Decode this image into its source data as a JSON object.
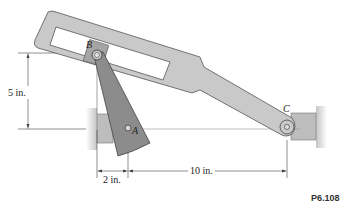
{
  "figure": {
    "id_label": "P6.108",
    "points": {
      "A": "A",
      "B": "B",
      "C": "C"
    },
    "dimensions": {
      "vertical": "5 in.",
      "horizontal_short": "2 in.",
      "horizontal_long": "10 in."
    },
    "colors": {
      "member_fill": "#c9c9c9",
      "member_stroke": "#555555",
      "arm_fill": "#8c8c8c",
      "block_fill": "#b5b5b5",
      "wall_fill": "#d6d6d6",
      "dim_line": "#444444"
    }
  }
}
